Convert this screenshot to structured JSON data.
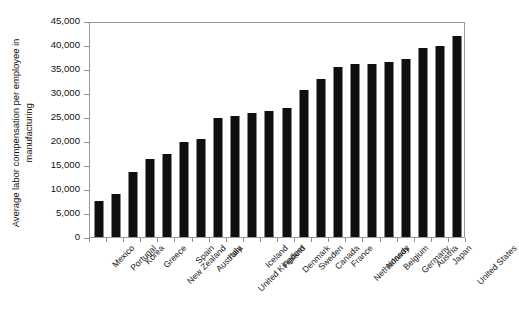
{
  "chart_data": {
    "type": "bar",
    "title": "",
    "subtitle": "",
    "xlabel": "",
    "ylabel": "Average labor compensation per employee in manufacturing",
    "ylim": [
      0,
      45000
    ],
    "ytick_labels": [
      "0",
      "5,000",
      "10,000",
      "15,000",
      "20,000",
      "25,000",
      "30,000",
      "35,000",
      "40,000",
      "45,000"
    ],
    "ytick_values": [
      0,
      5000,
      10000,
      15000,
      20000,
      25000,
      30000,
      35000,
      40000,
      45000
    ],
    "grid": false,
    "legend": null,
    "bar_color": "#101010",
    "categories": [
      "Mexico",
      "Portugal",
      "Korea",
      "Greece",
      "New Zealand",
      "Spain",
      "Australia",
      "Italy",
      "United Kingdom",
      "Iceland",
      "Finland",
      "Denmark",
      "Sweden",
      "Canada",
      "France",
      "Netherlands",
      "Norway",
      "Belgium",
      "Germany",
      "Austria",
      "Japan",
      "United States"
    ],
    "values": [
      7500,
      8900,
      13500,
      16200,
      17200,
      19800,
      20500,
      24800,
      25300,
      25800,
      26300,
      26800,
      30700,
      33000,
      35400,
      36000,
      36100,
      36500,
      37000,
      39300,
      39700,
      41800
    ]
  }
}
